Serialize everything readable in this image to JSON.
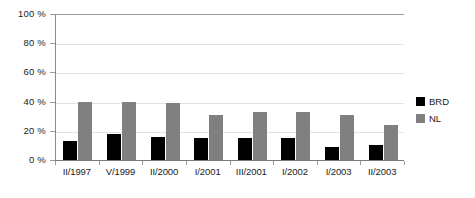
{
  "chart_data": {
    "type": "bar",
    "title": "",
    "subtitle": "",
    "xlabel": "",
    "ylabel": "",
    "categories": [
      "II/1997",
      "V/1999",
      "II/2000",
      "I/2001",
      "III/2001",
      "I/2002",
      "I/2003",
      "II/2003"
    ],
    "series": [
      {
        "name": "BRD",
        "color": "#000000",
        "values": [
          13,
          18,
          16,
          15,
          15,
          15,
          9,
          10
        ]
      },
      {
        "name": "NL",
        "color": "#808080",
        "values": [
          40,
          40,
          39,
          31,
          33,
          33,
          31,
          24
        ]
      }
    ],
    "ylim": [
      0,
      100
    ],
    "ytick_values": [
      0,
      20,
      40,
      60,
      80,
      100
    ],
    "ytick_labels": [
      "0 %",
      "20 %",
      "40 %",
      "60 %",
      "80 %",
      "100 %"
    ],
    "grid": true,
    "grid_axis": "y",
    "legend_position": "right",
    "legend": [
      {
        "label": "BRD",
        "color": "#000000"
      },
      {
        "label": "NL",
        "color": "#808080"
      }
    ],
    "value_unit": "%"
  },
  "colors": {
    "series_brd": "#000000",
    "series_nl": "#808080",
    "axis": "#7d7d7d",
    "gridline": "#e2e2e2",
    "text": "#1a1a1a",
    "background": "#ffffff"
  }
}
